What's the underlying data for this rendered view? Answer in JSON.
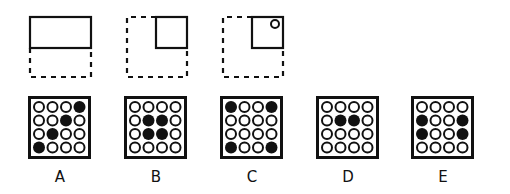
{
  "puzzle": {
    "figures": [
      {
        "name": "figure-1",
        "solid_part": "top-half",
        "dashed_part": "bottom-half",
        "has_circle": false
      },
      {
        "name": "figure-2",
        "solid_part": "top-right-quarter",
        "dashed_part": "rest",
        "has_circle": false
      },
      {
        "name": "figure-3",
        "solid_part": "top-right-quarter",
        "dashed_part": "rest",
        "has_circle": true,
        "circle_position": "top-right"
      }
    ],
    "options": [
      {
        "label": "A",
        "grid": [
          [
            0,
            0,
            0,
            1
          ],
          [
            0,
            0,
            1,
            0
          ],
          [
            0,
            1,
            0,
            0
          ],
          [
            1,
            0,
            0,
            0
          ]
        ]
      },
      {
        "label": "B",
        "grid": [
          [
            0,
            0,
            0,
            0
          ],
          [
            0,
            1,
            1,
            0
          ],
          [
            0,
            1,
            1,
            0
          ],
          [
            0,
            0,
            0,
            0
          ]
        ]
      },
      {
        "label": "C",
        "grid": [
          [
            1,
            0,
            0,
            1
          ],
          [
            0,
            0,
            0,
            0
          ],
          [
            0,
            0,
            0,
            0
          ],
          [
            1,
            0,
            0,
            1
          ]
        ]
      },
      {
        "label": "D",
        "grid": [
          [
            0,
            0,
            0,
            0
          ],
          [
            0,
            1,
            1,
            0
          ],
          [
            0,
            0,
            0,
            0
          ],
          [
            0,
            0,
            0,
            0
          ]
        ]
      },
      {
        "label": "E",
        "grid": [
          [
            0,
            0,
            0,
            0
          ],
          [
            1,
            0,
            0,
            1
          ],
          [
            1,
            0,
            0,
            1
          ],
          [
            0,
            0,
            0,
            0
          ]
        ]
      }
    ]
  },
  "colors": {
    "ink": "#111111",
    "paper": "#ffffff"
  }
}
